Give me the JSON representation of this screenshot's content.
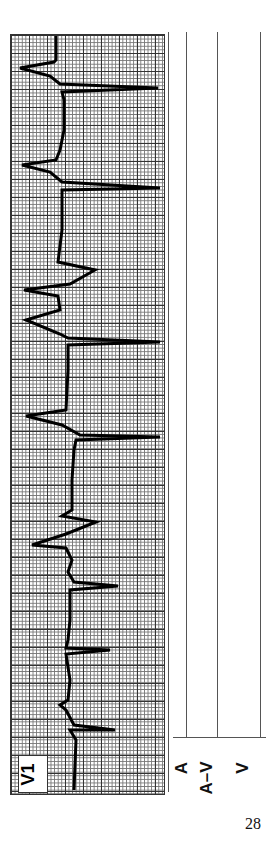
{
  "figure": {
    "lead_label": "V1",
    "ladder_labels": [
      "A",
      "A–V",
      "V"
    ],
    "page_number": "28"
  }
}
